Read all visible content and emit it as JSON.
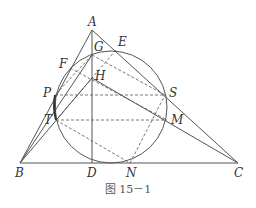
{
  "figure": {
    "caption": "图 15－1",
    "colors": {
      "stroke": "#555555",
      "text": "#333333",
      "background": "#ffffff"
    },
    "circle": {
      "cx": 111,
      "cy": 107,
      "r": 56
    },
    "points": {
      "A": {
        "label": "A",
        "x": 92,
        "y": 30
      },
      "B": {
        "label": "B",
        "x": 20,
        "y": 163
      },
      "C": {
        "label": "C",
        "x": 238,
        "y": 163
      },
      "D": {
        "label": "D",
        "x": 92,
        "y": 163
      },
      "N": {
        "label": "N",
        "x": 130,
        "y": 163
      },
      "G": {
        "label": "G",
        "x": 92,
        "y": 55
      },
      "E": {
        "label": "E",
        "x": 116,
        "y": 50
      },
      "F": {
        "label": "F",
        "x": 70,
        "y": 68
      },
      "H": {
        "label": "H",
        "x": 92,
        "y": 78
      },
      "P": {
        "label": "P",
        "x": 55,
        "y": 95
      },
      "S": {
        "label": "S",
        "x": 165,
        "y": 95
      },
      "T": {
        "label": "T",
        "x": 56,
        "y": 120
      },
      "M": {
        "label": "M",
        "x": 167,
        "y": 120
      }
    },
    "solid_segments": [
      [
        "A",
        "B"
      ],
      [
        "A",
        "C"
      ],
      [
        "B",
        "C"
      ],
      [
        "A",
        "D"
      ],
      [
        "B",
        "G"
      ],
      [
        "B",
        "H"
      ],
      [
        "H",
        "C"
      ],
      [
        "P",
        "T"
      ]
    ],
    "dashed_segments": [
      [
        "G",
        "S"
      ],
      [
        "F",
        "M"
      ],
      [
        "P",
        "S"
      ],
      [
        "T",
        "M"
      ],
      [
        "T",
        "N"
      ],
      [
        "N",
        "S"
      ],
      [
        "E",
        "T"
      ],
      [
        "G",
        "P"
      ]
    ]
  }
}
